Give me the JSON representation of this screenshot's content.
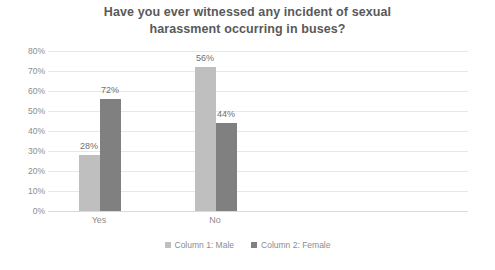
{
  "chart_data": {
    "type": "bar",
    "title": "Have you ever witnessed any incident of sexual harassment occurring in buses?",
    "title_line1": "Have you ever witnessed any incident of sexual",
    "title_line2": "harassment occurring in buses?",
    "xlabel": "",
    "ylabel": "",
    "categories": [
      "Yes",
      "No"
    ],
    "series": [
      {
        "name": "Column 1: Male",
        "color": "#bfbfbf",
        "values": [
          28,
          72
        ],
        "labels": [
          "28%",
          "56%"
        ]
      },
      {
        "name": "Column 2: Female",
        "color": "#808080",
        "values": [
          56,
          44
        ],
        "labels": [
          "72%",
          "44%"
        ]
      }
    ],
    "data_labels": {
      "yes_male": "28%",
      "yes_female": "56%",
      "no_male": "72%",
      "no_female": "44%"
    },
    "ylim": [
      0,
      80
    ],
    "ytick_step": 10,
    "ytick_labels": [
      "80%",
      "70%",
      "60%",
      "50%",
      "40%",
      "30%",
      "20%",
      "10%",
      "0%"
    ],
    "grid": true,
    "legend_position": "bottom"
  },
  "legend": {
    "items": [
      {
        "label": "Column 1: Male",
        "color": "#bfbfbf"
      },
      {
        "label": "Column 2: Female",
        "color": "#808080"
      }
    ]
  },
  "colors": {
    "series_light": "#bfbfbf",
    "series_dark": "#808080",
    "gridline": "#e8e8e8",
    "axis_text": "#8c8c8c",
    "title_text": "#595959",
    "label_text": "#6f6f6f",
    "background": "#ffffff"
  }
}
